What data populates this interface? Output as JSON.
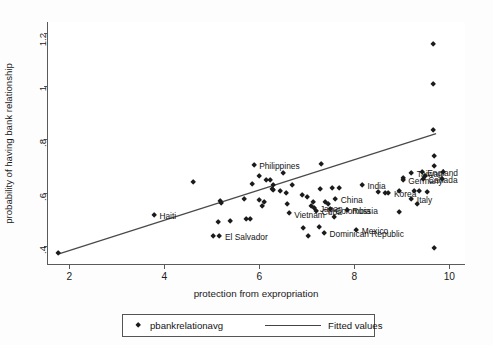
{
  "chart_data": {
    "type": "scatter",
    "title": "",
    "xlabel": "protection from expropriation",
    "ylabel": "probability of having bank relationship",
    "xlim": [
      1.55,
      10.35
    ],
    "ylim": [
      0.33,
      1.24
    ],
    "xticks": [
      2,
      4,
      6,
      8,
      10
    ],
    "xticklabels": [
      "2",
      "4",
      "6",
      "8",
      "10"
    ],
    "yticks": [
      0.4,
      0.6,
      0.8,
      1,
      1.2
    ],
    "yticklabels": [
      ".4",
      ".6",
      ".8",
      "1",
      "1.2"
    ],
    "grid": false,
    "legend_position": "below-axes",
    "legend": [
      {
        "label": "pbankrelationavg",
        "marker": "diamond",
        "color": "#1b1b1b"
      },
      {
        "label": "Fitted values",
        "marker": "line",
        "color": "#444444"
      }
    ],
    "fit_line": {
      "x": [
        1.78,
        9.72
      ],
      "y": [
        0.372,
        0.822
      ]
    },
    "points": [
      {
        "x": 1.78,
        "y": 0.372,
        "label": ""
      },
      {
        "x": 3.8,
        "y": 0.512,
        "label": "Haiti",
        "label_pos": "right"
      },
      {
        "x": 4.62,
        "y": 0.637,
        "label": ""
      },
      {
        "x": 5.2,
        "y": 0.567,
        "label": ""
      },
      {
        "x": 5.22,
        "y": 0.558,
        "label": ""
      },
      {
        "x": 5.15,
        "y": 0.487,
        "label": ""
      },
      {
        "x": 5.4,
        "y": 0.49,
        "label": ""
      },
      {
        "x": 5.05,
        "y": 0.434,
        "label": ""
      },
      {
        "x": 5.18,
        "y": 0.434,
        "label": "El Salvador",
        "label_pos": "right"
      },
      {
        "x": 5.9,
        "y": 0.7,
        "label": "Philippines",
        "label_pos": "right"
      },
      {
        "x": 5.86,
        "y": 0.629,
        "label": ""
      },
      {
        "x": 6.16,
        "y": 0.643,
        "label": ""
      },
      {
        "x": 6.24,
        "y": 0.643,
        "label": ""
      },
      {
        "x": 6.3,
        "y": 0.625,
        "label": ""
      },
      {
        "x": 6.28,
        "y": 0.609,
        "label": ""
      },
      {
        "x": 6.02,
        "y": 0.658,
        "label": ""
      },
      {
        "x": 5.7,
        "y": 0.572,
        "label": ""
      },
      {
        "x": 6.02,
        "y": 0.568,
        "label": ""
      },
      {
        "x": 6.12,
        "y": 0.56,
        "label": ""
      },
      {
        "x": 6.08,
        "y": 0.546,
        "label": ""
      },
      {
        "x": 5.75,
        "y": 0.5,
        "label": ""
      },
      {
        "x": 5.82,
        "y": 0.498,
        "label": ""
      },
      {
        "x": 6.52,
        "y": 0.67,
        "label": ""
      },
      {
        "x": 6.3,
        "y": 0.605,
        "label": ""
      },
      {
        "x": 6.46,
        "y": 0.604,
        "label": ""
      },
      {
        "x": 6.58,
        "y": 0.596,
        "label": ""
      },
      {
        "x": 6.72,
        "y": 0.627,
        "label": ""
      },
      {
        "x": 6.6,
        "y": 0.556,
        "label": ""
      },
      {
        "x": 6.64,
        "y": 0.519,
        "label": "Vietnam",
        "label_pos": "right"
      },
      {
        "x": 6.92,
        "y": 0.588,
        "label": ""
      },
      {
        "x": 7.02,
        "y": 0.58,
        "label": ""
      },
      {
        "x": 7.16,
        "y": 0.563,
        "label": ""
      },
      {
        "x": 7.1,
        "y": 0.545,
        "label": ""
      },
      {
        "x": 7.18,
        "y": 0.541,
        "label": "Japan",
        "label_pos": "right"
      },
      {
        "x": 7.22,
        "y": 0.529,
        "label": "Cuba",
        "label_pos": "right"
      },
      {
        "x": 7.4,
        "y": 0.562,
        "label": ""
      },
      {
        "x": 7.46,
        "y": 0.556,
        "label": ""
      },
      {
        "x": 7.5,
        "y": 0.534,
        "label": "Colombia",
        "label_pos": "right"
      },
      {
        "x": 7.62,
        "y": 0.572,
        "label": "China",
        "label_pos": "right"
      },
      {
        "x": 7.3,
        "y": 0.61,
        "label": ""
      },
      {
        "x": 7.32,
        "y": 0.705,
        "label": ""
      },
      {
        "x": 7.56,
        "y": 0.615,
        "label": ""
      },
      {
        "x": 7.7,
        "y": 0.616,
        "label": ""
      },
      {
        "x": 7.86,
        "y": 0.533,
        "label": "Russia",
        "label_pos": "right"
      },
      {
        "x": 6.94,
        "y": 0.465,
        "label": ""
      },
      {
        "x": 7.28,
        "y": 0.469,
        "label": ""
      },
      {
        "x": 7.38,
        "y": 0.445,
        "label": "Dominican Republic",
        "label_pos": "right"
      },
      {
        "x": 7.04,
        "y": 0.436,
        "label": ""
      },
      {
        "x": 7.6,
        "y": 0.504,
        "label": ""
      },
      {
        "x": 8.06,
        "y": 0.458,
        "label": "Mexico",
        "label_pos": "right"
      },
      {
        "x": 8.18,
        "y": 0.625,
        "label": "India",
        "label_pos": "right"
      },
      {
        "x": 8.52,
        "y": 0.6,
        "label": ""
      },
      {
        "x": 8.66,
        "y": 0.596,
        "label": ""
      },
      {
        "x": 8.74,
        "y": 0.596,
        "label": "Korea",
        "label_pos": "right"
      },
      {
        "x": 8.96,
        "y": 0.604,
        "label": ""
      },
      {
        "x": 9.04,
        "y": 0.652,
        "label": ""
      },
      {
        "x": 8.96,
        "y": 0.523,
        "label": ""
      },
      {
        "x": 9.22,
        "y": 0.672,
        "label": "Taiwan",
        "label_pos": "right"
      },
      {
        "x": 9.04,
        "y": 0.645,
        "label": "Germany",
        "label_pos": "right"
      },
      {
        "x": 9.44,
        "y": 0.676,
        "label": "England",
        "label_pos": "right"
      },
      {
        "x": 9.52,
        "y": 0.66,
        "label": ""
      },
      {
        "x": 9.46,
        "y": 0.647,
        "label": "Canada",
        "label_pos": "right"
      },
      {
        "x": 9.28,
        "y": 0.603,
        "label": ""
      },
      {
        "x": 9.38,
        "y": 0.603,
        "label": ""
      },
      {
        "x": 9.56,
        "y": 0.6,
        "label": ""
      },
      {
        "x": 9.22,
        "y": 0.573,
        "label": "Italy",
        "label_pos": "right"
      },
      {
        "x": 9.34,
        "y": 0.553,
        "label": ""
      },
      {
        "x": 9.7,
        "y": 0.733,
        "label": ""
      },
      {
        "x": 9.7,
        "y": 0.698,
        "label": ""
      },
      {
        "x": 9.68,
        "y": 0.83,
        "label": ""
      },
      {
        "x": 9.68,
        "y": 1.002,
        "label": ""
      },
      {
        "x": 9.68,
        "y": 1.152,
        "label": ""
      },
      {
        "x": 9.7,
        "y": 0.39,
        "label": ""
      },
      {
        "x": 9.88,
        "y": 0.676,
        "label": ""
      },
      {
        "x": 9.86,
        "y": 0.648,
        "label": ""
      }
    ]
  }
}
